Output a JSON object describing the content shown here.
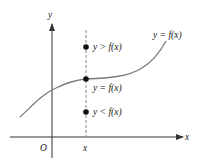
{
  "diagram": {
    "title": "",
    "axes": {
      "x_label": "x",
      "y_label": "y",
      "origin_label": "O",
      "x_tick_label": "x"
    },
    "curve": {
      "label": "y = f(x)",
      "color": "#7a7a7a"
    },
    "points": [
      {
        "label": "y > f(x)",
        "relation": "above"
      },
      {
        "label": "y = f(x)",
        "relation": "on"
      },
      {
        "label": "y < f(x)",
        "relation": "below"
      }
    ],
    "colors": {
      "axis": "#333333",
      "dashed": "#888888",
      "point": "#111111"
    }
  }
}
